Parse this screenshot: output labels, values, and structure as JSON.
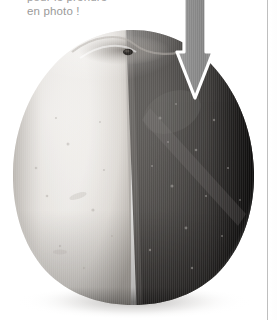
{
  "page": {
    "background_color": "#ffffff",
    "width": 277,
    "height": 320,
    "rule_color": "#c2c2c2"
  },
  "caption": {
    "line1": "pour le prendre",
    "line2": "en photo !",
    "color": "#9a9a9a",
    "clipped_at_top": true
  },
  "photo": {
    "subject": "apple",
    "description": "A single apple photographed straight on, filling most of the frame and cropped at the bottom edge of the page. The fruit is split vertically down the middle: the left half is rendered very light (near white / pale grey) while the right half is rendered dark (deep charcoal grey), illustrating a strong light/dark contrast comparison.",
    "left_half_color": "#e9e7e4",
    "left_half_shadow_color": "#b9b5b0",
    "right_half_color": "#565452",
    "right_half_dark_edge_color": "#1b1a19",
    "stem_color": "#2a2724",
    "ground_shadow_color": "#d8d6d4",
    "divider_x_top": 125,
    "divider_x_bottom": 136
  },
  "arrow": {
    "direction": "down",
    "fill_color": "#8c8c8c",
    "outline_color": "#ffffff",
    "shaft_left_x": 176,
    "shaft_right_x": 206,
    "head_left_x": 169,
    "head_right_x": 213,
    "head_top_y": 52,
    "tip_y": 98
  }
}
